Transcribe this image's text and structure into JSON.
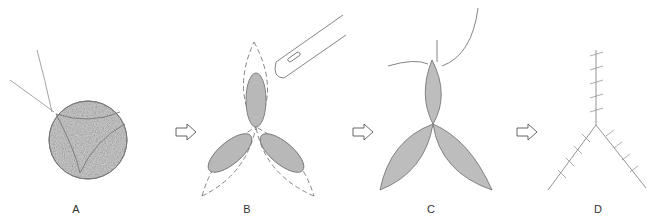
{
  "panels": [
    {
      "label": "A",
      "description": "circular defect with three curved incision lines and suture",
      "label_x": 66,
      "label_y": 203
    },
    {
      "label": "B",
      "description": "three elliptical flaps with dashed incision outlines and scalpel",
      "label_x": 237,
      "label_y": 203
    },
    {
      "label": "C",
      "description": "three spindle-shaped flaps being sutured",
      "label_x": 421,
      "label_y": 203
    },
    {
      "label": "D",
      "description": "final Y-shaped sutured closure",
      "label_x": 588,
      "label_y": 203
    }
  ],
  "arrows": [
    {
      "name": "arrow-a-to-b",
      "x": 176,
      "y": 132
    },
    {
      "name": "arrow-b-to-c",
      "x": 353,
      "y": 132
    },
    {
      "name": "arrow-c-to-d",
      "x": 517,
      "y": 132
    }
  ],
  "colors": {
    "stroke": "#6b6b6b",
    "fill": "#c9c9c9",
    "dark_fill": "#b4b4b4"
  }
}
